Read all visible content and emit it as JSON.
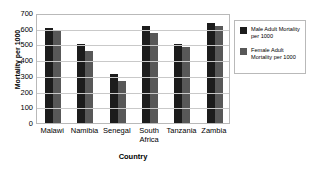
{
  "chart_data": {
    "type": "bar",
    "title": "",
    "xlabel": "Country",
    "ylabel": "Mortality per 1000",
    "categories": [
      "Malawi",
      "Namibia",
      "Senegal",
      "South\nAfrica",
      "Tanzania",
      "Zambia"
    ],
    "series": [
      {
        "name": "Male Adult Mortality\nper 1000",
        "color": "#1c1c1c",
        "values": [
          605,
          500,
          315,
          620,
          503,
          638
        ]
      },
      {
        "name": "Female Adult\nMortality per 1000",
        "color": "#585858",
        "values": [
          593,
          460,
          270,
          570,
          482,
          615
        ]
      }
    ],
    "ylim": [
      0,
      700
    ],
    "yticks": [
      "0",
      "100",
      "200",
      "300",
      "400",
      "500",
      "600",
      "700"
    ],
    "grid": true,
    "legend_position": "right"
  },
  "legend": {
    "items": [
      {
        "label": "Male Adult Mortality\nper 1000"
      },
      {
        "label": "Female Adult\nMortality per 1000"
      }
    ]
  },
  "colors": {
    "male_bar": "#1c1c1c",
    "female_bar": "#585858",
    "gridline": "#c9c9c9",
    "frame": "#b9b9b9",
    "background": "#ffffff"
  }
}
